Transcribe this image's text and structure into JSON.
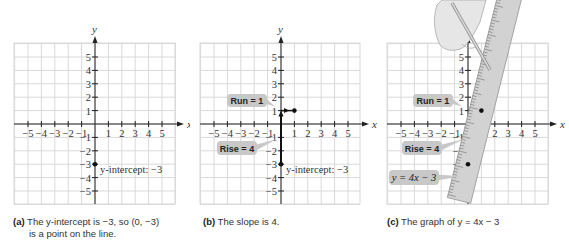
{
  "panels": [
    {
      "id": "a",
      "caption_label": "(a)",
      "caption_line1": "The y-intercept is −3, so (0, −3)",
      "caption_line2": "is a point on the line.",
      "intercept_label": "y-intercept: −3"
    },
    {
      "id": "b",
      "caption_label": "(b)",
      "caption_line1": "The slope is 4.",
      "run_label": "Run = 1",
      "rise_label": "Rise = 4",
      "intercept_label": "y-intercept: −3"
    },
    {
      "id": "c",
      "caption_label": "(c)",
      "caption_line1": "The graph of y = 4x − 3",
      "run_label": "Run = 1",
      "rise_label": "Rise = 4",
      "equation_label": "y = 4x − 3"
    }
  ],
  "axes": {
    "x_label": "x",
    "y_label": "y",
    "x_ticks": [
      "−5",
      "−4",
      "−3",
      "−2",
      "−1",
      "1",
      "2",
      "3",
      "4",
      "5"
    ],
    "y_ticks": [
      "5",
      "4",
      "3",
      "2",
      "1",
      "−1",
      "−2",
      "−3",
      "−4",
      "−5"
    ]
  },
  "colors": {
    "grid": "#d9d9d9",
    "axis": "#222222",
    "callout_bg": "#c8c8c8",
    "ruler": "#d2d2d2",
    "hand": "#e6e6e6"
  },
  "chart_data": {
    "type": "line",
    "xlabel": "x",
    "ylabel": "y",
    "xlim": [
      -5,
      5
    ],
    "ylim": [
      -5,
      5
    ],
    "grid": true,
    "points": [
      {
        "x": 0,
        "y": -3,
        "label": "y-intercept: −3"
      },
      {
        "x": 1,
        "y": 1,
        "label": "after Run = 1, Rise = 4"
      }
    ],
    "slope": 4,
    "intercept": -3,
    "equation": "y = 4x − 3",
    "annotations": [
      "Run = 1",
      "Rise = 4",
      "y-intercept: −3",
      "y = 4x − 3"
    ]
  }
}
